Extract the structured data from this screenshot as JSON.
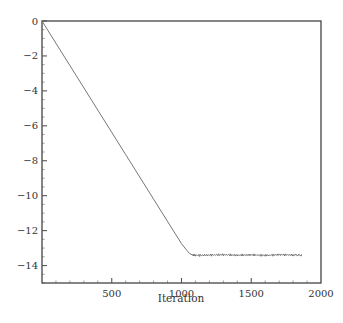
{
  "chart_data": {
    "type": "line",
    "title": "",
    "xlabel": "Iteration",
    "ylabel": "",
    "xlim": [
      0,
      2000
    ],
    "ylim": [
      -15,
      0
    ],
    "x_ticks": [
      500,
      1000,
      1500,
      2000
    ],
    "x_tick_labels": [
      "500",
      "1000",
      "1500",
      "2000"
    ],
    "y_ticks": [
      0,
      -2,
      -4,
      -6,
      -8,
      -10,
      -12,
      -14
    ],
    "y_tick_labels": [
      "0",
      "−2",
      "−4",
      "−6",
      "−8",
      "−10",
      "−12",
      "−14"
    ],
    "grid": false,
    "legend": null,
    "series": [
      {
        "name": "residual",
        "color": "#777777",
        "x": [
          0,
          200,
          400,
          600,
          800,
          1000,
          1040,
          1060,
          1080,
          1100,
          1200,
          1300,
          1400,
          1500,
          1600,
          1700,
          1800,
          1864
        ],
        "y": [
          0,
          -2.55,
          -5.1,
          -7.65,
          -10.2,
          -12.75,
          -13.15,
          -13.32,
          -13.4,
          -13.42,
          -13.4,
          -13.38,
          -13.41,
          -13.39,
          -13.42,
          -13.38,
          -13.4,
          -13.41
        ]
      }
    ],
    "annotations": []
  }
}
